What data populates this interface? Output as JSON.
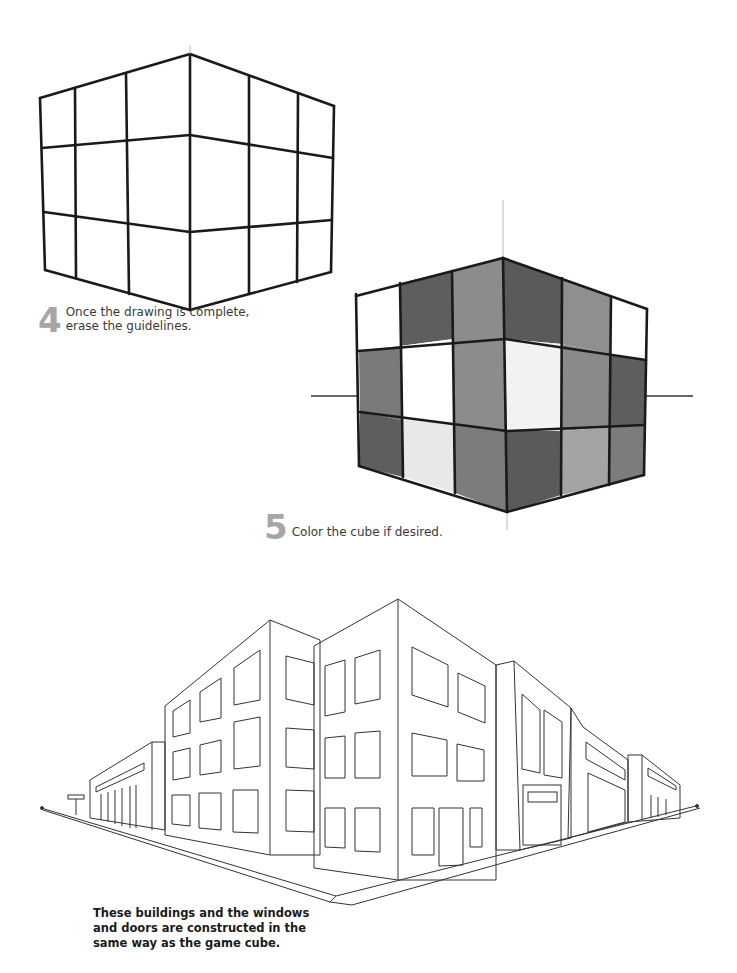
{
  "steps": [
    {
      "number": "4",
      "text_line1": "Once the drawing is complete,",
      "text_line2": "erase the guidelines."
    },
    {
      "number": "5",
      "text_line1": "Color the cube if desired."
    }
  ],
  "caption": {
    "line1": "These buildings and the windows",
    "line2": "and doors are constructed in the",
    "line3": "same way as the game cube."
  },
  "illustrations": {
    "cube_outline": "two-point-perspective-cube-3x3-grid",
    "cube_colored": "two-point-perspective-cube-shaded",
    "street_scene": "two-point-perspective-street-buildings"
  },
  "colors": {
    "step_number": "#a6a6a6",
    "ink": "#1a1a1a",
    "shade_dark": "#5a5a5a",
    "shade_mid": "#8a8a8a",
    "shade_light": "#e8e8e8"
  }
}
